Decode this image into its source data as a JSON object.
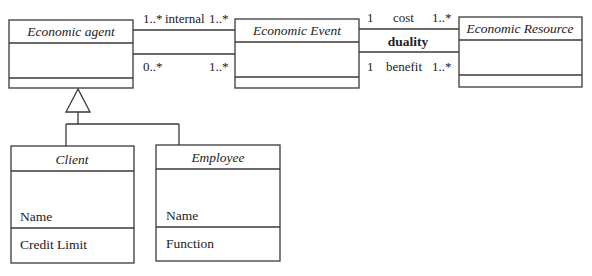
{
  "diagram": {
    "type": "UML class diagram",
    "classes": {
      "economic_agent": {
        "name": "Economic agent",
        "attributes": []
      },
      "economic_event": {
        "name": "Economic Event",
        "attributes": []
      },
      "economic_resource": {
        "name": "Economic Resource",
        "attributes": []
      },
      "client": {
        "name": "Client",
        "attributes": [
          "Name",
          "Credit Limit"
        ]
      },
      "employee": {
        "name": "Employee",
        "attributes": [
          "Name",
          "Function"
        ]
      }
    },
    "associations": {
      "internal": {
        "label": "internal",
        "from_mult": "1..*",
        "to_mult": "1..*"
      },
      "agent_event_2": {
        "label": "",
        "from_mult": "0..*",
        "to_mult": "1..*"
      },
      "cost": {
        "label": "cost",
        "from_mult": "1",
        "to_mult": "1..*"
      },
      "benefit": {
        "label": "benefit",
        "from_mult": "1",
        "to_mult": "1..*"
      },
      "duality": {
        "label": "duality"
      }
    },
    "generalization": {
      "parent": "Economic agent",
      "children": [
        "Client",
        "Employee"
      ]
    }
  }
}
